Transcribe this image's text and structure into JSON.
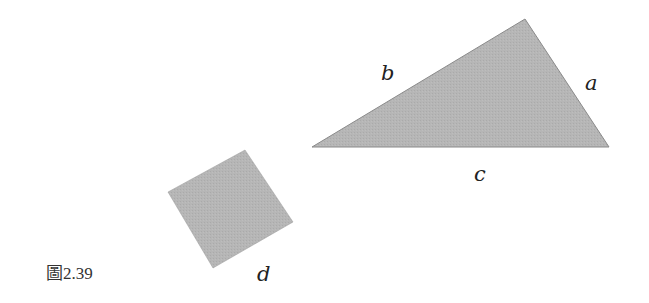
{
  "figure": {
    "caption": "圖2.39",
    "fill_color": "#b4b4b4",
    "edge_color": "#8a8a8a",
    "triangle": {
      "vertices": [
        [
          312,
          147
        ],
        [
          525,
          19
        ],
        [
          609,
          147
        ]
      ],
      "labels": {
        "a": {
          "text": "a",
          "x": 585,
          "y": 90
        },
        "b": {
          "text": "b",
          "x": 381,
          "y": 80
        },
        "c": {
          "text": "c",
          "x": 474,
          "y": 181
        }
      }
    },
    "square": {
      "vertices": [
        [
          245,
          150
        ],
        [
          293,
          222
        ],
        [
          213,
          268
        ],
        [
          168,
          192
        ]
      ],
      "label": {
        "text": "d",
        "x": 257,
        "y": 281
      }
    }
  }
}
